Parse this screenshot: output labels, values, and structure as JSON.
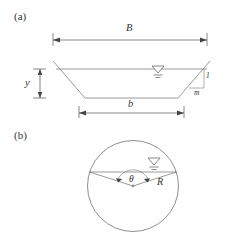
{
  "figure": {
    "panels": [
      {
        "id": "a",
        "label": "(a)",
        "description": "Trapezoidal channel cross-section",
        "labels": {
          "top_width": "B",
          "depth": "y",
          "bottom_width": "b",
          "side_slope_vertical": "1",
          "side_slope_horizontal": "m"
        },
        "symbols": {
          "water_surface": "water-surface-symbol"
        }
      },
      {
        "id": "b",
        "label": "(b)",
        "description": "Circular channel cross-section",
        "labels": {
          "angle": "θ",
          "radius": "R"
        },
        "symbols": {
          "water_surface": "water-surface-symbol"
        }
      }
    ]
  },
  "colors": {
    "line": "#6e6e6e",
    "dimension": "#555555",
    "text": "#333333",
    "background": "#ffffff"
  }
}
